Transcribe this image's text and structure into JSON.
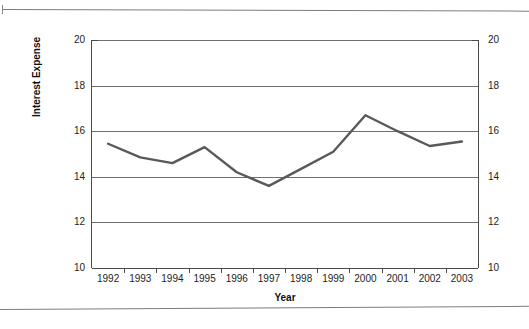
{
  "chart_data": {
    "type": "line",
    "title": "",
    "xlabel": "Year",
    "ylabel": "Interest Expense",
    "categories": [
      "1992",
      "1993",
      "1994",
      "1995",
      "1996",
      "1997",
      "1998",
      "1999",
      "2000",
      "2001",
      "2002",
      "2003"
    ],
    "values": [
      15.45,
      14.85,
      14.6,
      15.3,
      14.2,
      13.6,
      14.35,
      15.1,
      16.7,
      16.0,
      15.35,
      15.55
    ],
    "series": [
      {
        "name": "Interest Expense",
        "values": [
          15.45,
          14.85,
          14.6,
          15.3,
          14.2,
          13.6,
          14.35,
          15.1,
          16.7,
          16.0,
          15.35,
          15.55
        ]
      }
    ],
    "ylim": [
      10,
      20
    ],
    "yticks": [
      10,
      12,
      14,
      16,
      18,
      20
    ],
    "ytick_labels_left": [
      "20",
      "18",
      "16",
      "14",
      "12",
      "10"
    ],
    "ytick_labels_right": [
      "20",
      "18",
      "16",
      "14",
      "12",
      "10"
    ],
    "grid": true,
    "grid_axis": "y",
    "legend": "none",
    "line_color": "#58595b",
    "axis_color": "#4a4a4a",
    "grid_color": "#6f6f6f",
    "dual_y_axis": true
  },
  "axes": {
    "x_title": "Year",
    "y_title": "Interest Expense"
  },
  "page": {
    "rule_color": "#7d7d7d"
  }
}
